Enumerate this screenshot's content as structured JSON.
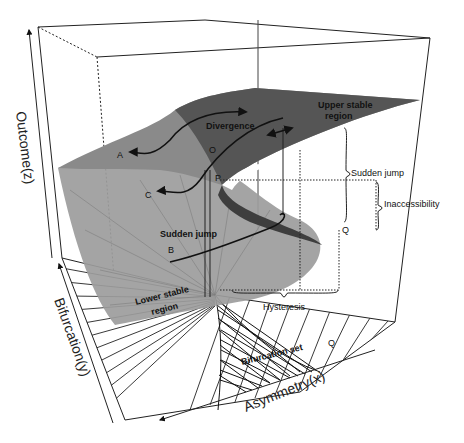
{
  "diagram": {
    "axes": {
      "z": "Outcome(z)",
      "y": "Bifurcation(y)",
      "x": "Asymmetry(x)"
    },
    "regions": {
      "upper": "Upper stable region",
      "upper_line1": "Upper stable",
      "upper_line2": "region",
      "lower_line1": "Lower stable",
      "lower_line2": "region",
      "bifurcation_set": "Bifurcation set"
    },
    "annotations": {
      "divergence": "Divergence",
      "sudden_jump_surface": "Sudden jump",
      "sudden_jump_bracket": "Sudden jump",
      "inaccessibility": "Inaccessibility",
      "hysteresis": "Hysteresis"
    },
    "points": {
      "A": "A",
      "B": "B",
      "C": "C",
      "O": "O",
      "P": "P",
      "Q_surface": "Q",
      "Q_base": "Q"
    },
    "colors": {
      "upper_surface": "#5a5a5a",
      "lower_surface": "#9a9a9a",
      "fold": "#3c3c3c",
      "lines": "#111111"
    }
  }
}
